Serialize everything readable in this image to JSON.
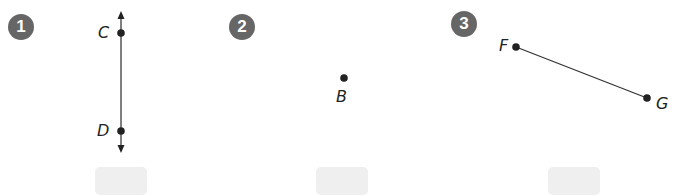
{
  "problems": [
    {
      "number": "1",
      "figure": "line",
      "points": [
        {
          "label": "C"
        },
        {
          "label": "D"
        }
      ],
      "answer": ""
    },
    {
      "number": "2",
      "figure": "point",
      "points": [
        {
          "label": "B"
        }
      ],
      "answer": ""
    },
    {
      "number": "3",
      "figure": "segment",
      "points": [
        {
          "label": "F"
        },
        {
          "label": "G"
        }
      ],
      "answer": ""
    }
  ],
  "colors": {
    "badge": "#666666",
    "answer_box": "#efefef",
    "ink": "#222222"
  }
}
